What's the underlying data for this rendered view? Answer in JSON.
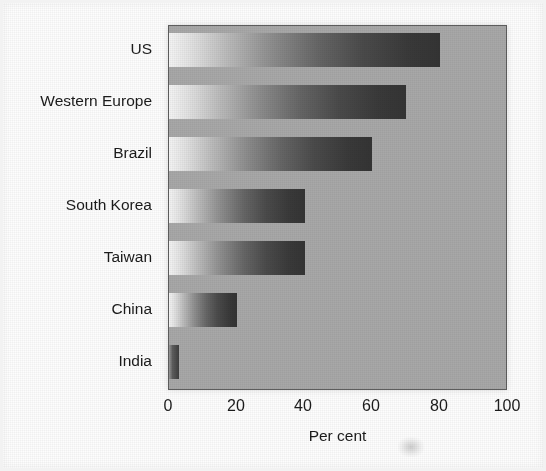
{
  "chart_data": {
    "type": "bar",
    "orientation": "horizontal",
    "title": "",
    "xlabel": "Per cent",
    "ylabel": "",
    "categories": [
      "US",
      "Western Europe",
      "Brazil",
      "South Korea",
      "Taiwan",
      "China",
      "India"
    ],
    "values": [
      80,
      70,
      60,
      40,
      40,
      20,
      3
    ],
    "xlim": [
      0,
      100
    ],
    "xticks": [
      0,
      20,
      40,
      60,
      80,
      100
    ],
    "xtick_labels": [
      "0",
      "20",
      "40",
      "60",
      "80",
      "100"
    ],
    "grid": false,
    "legend": null,
    "series": [
      {
        "name": "Per cent",
        "values": [
          80,
          70,
          60,
          40,
          40,
          20,
          3
        ]
      }
    ],
    "style": {
      "plot_background": "#a8a8a8",
      "plot_border": "#5e5e5e",
      "bar_fill_light": "#f4f4f4",
      "bar_fill_dark": "#343434",
      "page_background": "#fdfdfd",
      "text_color": "#1b1b1b"
    }
  },
  "axis": {
    "x_title": "Per cent",
    "ticks": [
      "0",
      "20",
      "40",
      "60",
      "80",
      "100"
    ]
  },
  "categories": {
    "items": [
      {
        "label": "US",
        "value": 80
      },
      {
        "label": "Western Europe",
        "value": 70
      },
      {
        "label": "Brazil",
        "value": 60
      },
      {
        "label": "South Korea",
        "value": 40
      },
      {
        "label": "Taiwan",
        "value": 40
      },
      {
        "label": "China",
        "value": 20
      },
      {
        "label": "India",
        "value": 3
      }
    ]
  },
  "layout": {
    "plot": {
      "left": 168,
      "top": 25,
      "width": 339,
      "height": 365
    },
    "row_height": 52,
    "bar_height": 34,
    "first_row_center": 49,
    "tick_x": [
      168,
      236,
      303,
      371,
      439,
      507
    ]
  }
}
